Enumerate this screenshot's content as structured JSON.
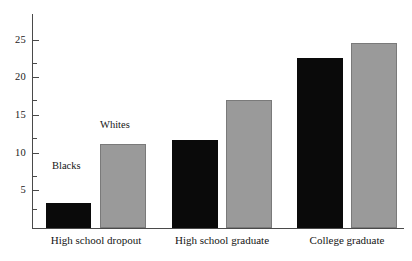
{
  "chart_data": {
    "type": "bar",
    "title": "",
    "xlabel": "",
    "ylabel": "",
    "categories": [
      "High school dropout",
      "High school graduate",
      "College graduate"
    ],
    "series": [
      {
        "name": "Blacks",
        "color": "#0a0a0a",
        "values": [
          3.3,
          11.7,
          22.6
        ]
      },
      {
        "name": "Whites",
        "color": "#9a9a9a",
        "values": [
          11.2,
          17.0,
          24.7
        ]
      }
    ],
    "ylim": [
      0,
      28.5
    ],
    "yticks_major": [
      5,
      10,
      15,
      20,
      25
    ],
    "yticks_major_labels": [
      "5",
      "10",
      "15",
      "20",
      "25"
    ],
    "yticks_minor": [
      2.5,
      7.5,
      12.5,
      17.5,
      22.5
    ],
    "grid": false,
    "legend": "inline-annotations",
    "annotations": [
      {
        "text": "Blacks",
        "series": "Blacks",
        "category": "High school dropout"
      },
      {
        "text": "Whites",
        "series": "Whites",
        "category": "High school dropout"
      }
    ]
  },
  "axis": {
    "y_label_5": "5",
    "y_label_10": "10",
    "y_label_15": "15",
    "y_label_20": "20",
    "y_label_25": "25"
  },
  "categories": {
    "cat_0": "High school dropout",
    "cat_1": "High school graduate",
    "cat_2": "College graduate"
  },
  "annotations": {
    "blacks": "Blacks",
    "whites": "Whites"
  },
  "colors": {
    "black_series": "#0a0a0a",
    "grey_series": "#9a9a9a",
    "axis": "#4a4a4a",
    "background": "#ffffff"
  }
}
